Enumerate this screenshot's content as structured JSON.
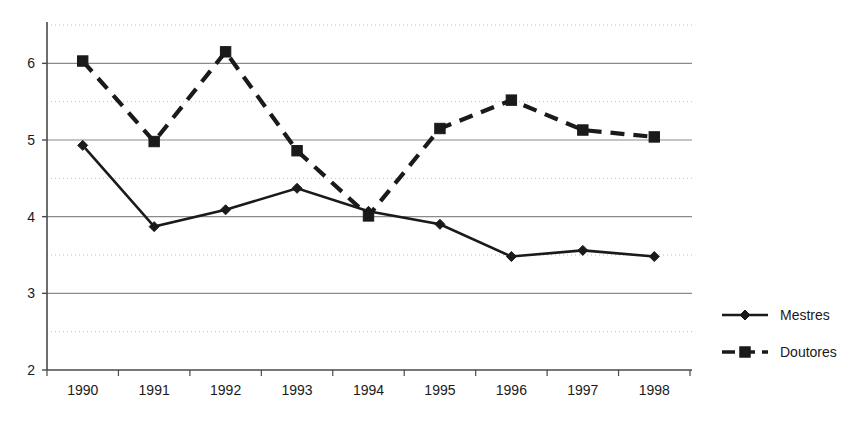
{
  "chart_data": {
    "type": "line",
    "title": "",
    "subtitle": "",
    "xlabel": "",
    "ylabel": "",
    "categories": [
      "1990",
      "1991",
      "1992",
      "1993",
      "1994",
      "1995",
      "1996",
      "1997",
      "1998"
    ],
    "series": [
      {
        "name": "Mestres",
        "marker": "diamond",
        "line_style": "solid",
        "color": "#1a1a1a",
        "values": [
          4.93,
          3.87,
          4.09,
          4.37,
          4.07,
          3.9,
          3.48,
          3.56,
          3.48
        ]
      },
      {
        "name": "Doutores",
        "marker": "square",
        "line_style": "dashed",
        "color": "#1a1a1a",
        "values": [
          6.03,
          4.98,
          6.15,
          4.86,
          4.01,
          5.15,
          5.52,
          5.13,
          5.04
        ]
      }
    ],
    "ylim": [
      2,
      6.5
    ],
    "yticks": [
      "2",
      "3",
      "4",
      "5",
      "6"
    ],
    "ytick_values": [
      2,
      3,
      4,
      5,
      6
    ],
    "minor_gridlines": [
      2.5,
      3.5,
      4.5,
      5.5,
      6.5
    ],
    "grid": "major-solid-minor-dotted",
    "legend_position": "right",
    "legend": [
      {
        "label": "Mestres",
        "marker": "diamond",
        "line_style": "solid"
      },
      {
        "label": "Doutores",
        "marker": "square",
        "line_style": "dashed"
      }
    ],
    "colors": {
      "axis": "#4a4a4a",
      "major_grid": "#8a8a8a",
      "minor_grid": "#bdbdbd",
      "series": "#1a1a1a",
      "background": "#ffffff"
    }
  }
}
